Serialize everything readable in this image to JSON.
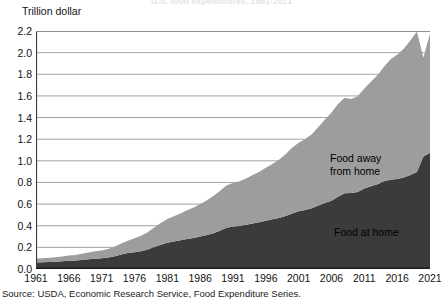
{
  "figure": {
    "title": "U.S. food expenditures, 1961-2021",
    "source": "Source: USDA, Economic Research Service, Food Expenditure Series."
  },
  "chart_data": {
    "type": "area",
    "stacked": true,
    "title": "U.S. food expenditures, 1961-2021",
    "xlabel": "",
    "ylabel": "Trillion dollar",
    "ylim": [
      0.0,
      2.2
    ],
    "xlim": [
      1961,
      2021
    ],
    "grid": true,
    "legend_position": "inline-annotation",
    "ytick_labels": [
      "0.0",
      "0.2",
      "0.4",
      "0.6",
      "0.8",
      "1.0",
      "1.2",
      "1.4",
      "1.6",
      "1.8",
      "2.0",
      "2.2"
    ],
    "ytick_values": [
      0.0,
      0.2,
      0.4,
      0.6,
      0.8,
      1.0,
      1.2,
      1.4,
      1.6,
      1.8,
      2.0,
      2.2
    ],
    "xtick_labels": [
      "1961",
      "1966",
      "1971",
      "1976",
      "1981",
      "1986",
      "1991",
      "1996",
      "2001",
      "2006",
      "2011",
      "2016",
      "2021"
    ],
    "xtick_values": [
      1961,
      1966,
      1971,
      1976,
      1981,
      1986,
      1991,
      1996,
      2001,
      2006,
      2011,
      2016,
      2021
    ],
    "x": [
      1961,
      1962,
      1963,
      1964,
      1965,
      1966,
      1967,
      1968,
      1969,
      1970,
      1971,
      1972,
      1973,
      1974,
      1975,
      1976,
      1977,
      1978,
      1979,
      1980,
      1981,
      1982,
      1983,
      1984,
      1985,
      1986,
      1987,
      1988,
      1989,
      1990,
      1991,
      1992,
      1993,
      1994,
      1995,
      1996,
      1997,
      1998,
      1999,
      2000,
      2001,
      2002,
      2003,
      2004,
      2005,
      2006,
      2007,
      2008,
      2009,
      2010,
      2011,
      2012,
      2013,
      2014,
      2015,
      2016,
      2017,
      2018,
      2019,
      2020,
      2021
    ],
    "series": [
      {
        "name": "Food at home",
        "color": "#3b3b3b",
        "values": [
          0.06,
          0.062,
          0.064,
          0.067,
          0.071,
          0.076,
          0.078,
          0.083,
          0.089,
          0.095,
          0.099,
          0.106,
          0.119,
          0.134,
          0.147,
          0.155,
          0.165,
          0.181,
          0.203,
          0.225,
          0.243,
          0.255,
          0.265,
          0.277,
          0.286,
          0.301,
          0.314,
          0.331,
          0.354,
          0.381,
          0.392,
          0.398,
          0.408,
          0.42,
          0.432,
          0.447,
          0.46,
          0.472,
          0.49,
          0.513,
          0.534,
          0.546,
          0.562,
          0.586,
          0.611,
          0.631,
          0.667,
          0.7,
          0.702,
          0.712,
          0.744,
          0.764,
          0.783,
          0.81,
          0.826,
          0.832,
          0.846,
          0.869,
          0.896,
          1.04,
          1.075
        ]
      },
      {
        "name": "Food away from home",
        "color": "#9d9d9d",
        "values": [
          0.036,
          0.038,
          0.04,
          0.042,
          0.045,
          0.049,
          0.052,
          0.057,
          0.063,
          0.069,
          0.073,
          0.08,
          0.09,
          0.101,
          0.115,
          0.129,
          0.142,
          0.159,
          0.18,
          0.2,
          0.22,
          0.233,
          0.247,
          0.266,
          0.283,
          0.3,
          0.319,
          0.343,
          0.366,
          0.39,
          0.402,
          0.412,
          0.428,
          0.449,
          0.468,
          0.489,
          0.511,
          0.537,
          0.57,
          0.608,
          0.632,
          0.655,
          0.684,
          0.727,
          0.771,
          0.815,
          0.858,
          0.883,
          0.869,
          0.884,
          0.925,
          0.967,
          1.007,
          1.06,
          1.113,
          1.148,
          1.19,
          1.243,
          1.3,
          0.912,
          1.102
        ]
      }
    ],
    "annotations": [
      {
        "text": "Food away from home",
        "series": "Food away from home",
        "x_approx": 2010,
        "y_approx": 1.25
      },
      {
        "text": "Food at home",
        "series": "Food at home",
        "x_approx": 2011,
        "y_approx": 0.45
      }
    ]
  },
  "axis_label": {
    "y": "Trillion dollar"
  },
  "labels": {
    "away_line1": "Food away",
    "away_line2": "from home",
    "at_home": "Food at home"
  }
}
